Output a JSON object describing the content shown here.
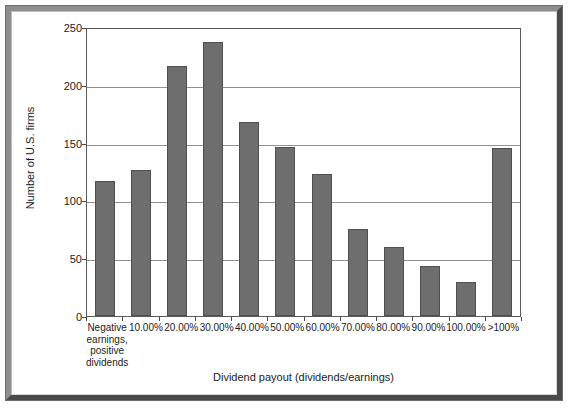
{
  "chart_data": {
    "type": "bar",
    "title": "",
    "xlabel": "Dividend payout (dividends/earnings)",
    "ylabel": "Number of U.S. firms",
    "ylim": [
      0,
      250
    ],
    "yticks": [
      0,
      50,
      100,
      150,
      200,
      250
    ],
    "ytick_labels": [
      "0",
      "50",
      "100",
      "150",
      "200",
      "250"
    ],
    "grid": "horizontal",
    "legend": "none",
    "bar_color": "#6e6e6e",
    "categories": [
      "Negative\nearnings,\npositive\ndividends",
      "10.00%",
      "20.00%",
      "30.00%",
      "40.00%",
      "50.00%",
      "60.00%",
      "70.00%",
      "80.00%",
      "90.00%",
      "100.00%",
      ">100%"
    ],
    "values": [
      117,
      126,
      216,
      237,
      168,
      146,
      123,
      75,
      60,
      43,
      29,
      145
    ]
  },
  "figure": {
    "border_color": "#6d6d6d",
    "background": "#ffffff"
  }
}
